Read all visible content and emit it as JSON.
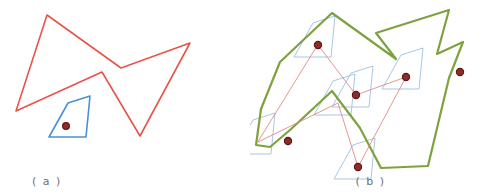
{
  "figure": {
    "width": 501,
    "height": 196,
    "background_color": "#ffffff"
  },
  "colors": {
    "red_polygon_stroke": "#e8544a",
    "blue_polygon_stroke": "#4a90d9",
    "green_polygon_stroke": "#7da23f",
    "light_blue_stroke": "#a8c7e8",
    "dot_fill": "#8f2b28",
    "dot_stroke": "#5e1a18",
    "thin_red_line": "#e08a82",
    "caption_text": "#6e6e6e"
  },
  "panels": [
    {
      "id": "a",
      "caption": "( a )",
      "description": "Input: a large concave red polygon and a small blue quadrilateral containing a reference point"
    },
    {
      "id": "b",
      "caption": "( b )",
      "description": "Result: green outline of the swept region with light-blue copies of the quadrilateral placed at each red polygon vertex"
    }
  ],
  "panel_a": {
    "red_polygon": {
      "name": "red-concave-polygon",
      "stroke_width": 1.6,
      "points": "47,15 121,68 190,43 140,136 102,72 16,111"
    },
    "blue_quad": {
      "name": "blue-quadrilateral",
      "stroke_width": 1.6,
      "points": "90,96 68,103 49,137 86,137"
    },
    "reference_point": {
      "name": "reference-point",
      "cx": 66,
      "cy": 126,
      "r": 3.4
    }
  },
  "panel_b": {
    "green_outline": {
      "name": "green-swept-outline",
      "stroke_width": 2.2,
      "points": "82,13 146,59 126,33 199,10 187,54 213,42 199,78 178,166 131,168 110,128 82,91 40,130 20,147 6,145 11,109 30,62"
    },
    "thin_red_edges": {
      "name": "red-vertex-path",
      "stroke_width": 0.9,
      "points": "68,45 106,95 156,77 108,167 88,103 8,142"
    },
    "light_blue_copies": [
      {
        "name": "blue-copy-1",
        "points": "85,16 63,23 44,57 81,57"
      },
      {
        "name": "blue-copy-2",
        "points": "123,66 101,73 82,107 119,107"
      },
      {
        "name": "blue-copy-3",
        "points": "173,48 151,55 132,89 169,89"
      },
      {
        "name": "blue-copy-4",
        "points": "125,138 103,145 84,179 121,179"
      },
      {
        "name": "blue-copy-5",
        "points": "105,74 83,81 64,115 101,115"
      },
      {
        "name": "blue-copy-6",
        "points": "25,113 3,120 -16,154 21,154"
      }
    ],
    "dots": [
      {
        "name": "vertex-dot-1",
        "cx": 68,
        "cy": 45,
        "r": 3.6
      },
      {
        "name": "vertex-dot-2",
        "cx": 106,
        "cy": 95,
        "r": 3.6
      },
      {
        "name": "vertex-dot-3",
        "cx": 156,
        "cy": 77,
        "r": 3.6
      },
      {
        "name": "vertex-dot-4",
        "cx": 108,
        "cy": 167,
        "r": 3.6
      },
      {
        "name": "vertex-dot-5",
        "cx": 210,
        "cy": 72,
        "r": 3.6
      },
      {
        "name": "vertex-dot-6",
        "cx": 38,
        "cy": 141,
        "r": 3.6
      }
    ]
  }
}
